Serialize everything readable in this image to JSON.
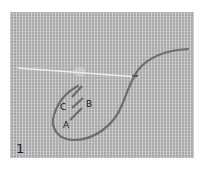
{
  "figure": {
    "step_number": "1",
    "labels": {
      "a": "A",
      "b": "B",
      "c": "C"
    },
    "colors": {
      "fabric": "#a9a9a9",
      "thread": "#6e6e6e",
      "needle": "#e6e6e6",
      "background": "#ffffff"
    }
  }
}
